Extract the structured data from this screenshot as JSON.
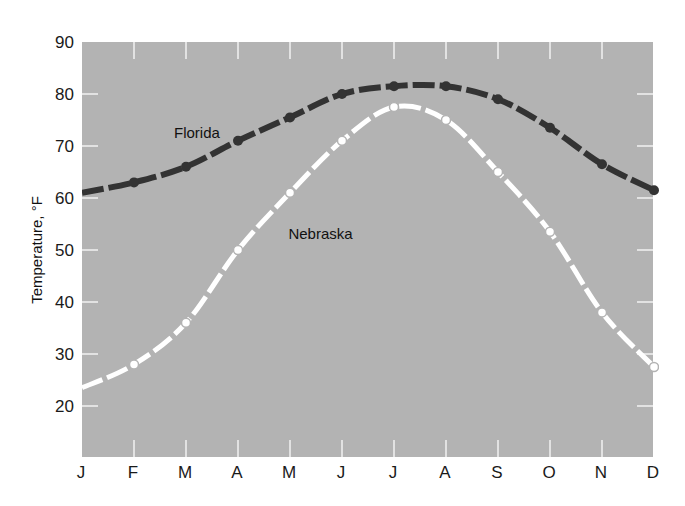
{
  "chart_data": {
    "type": "line",
    "title": "",
    "xlabel": "",
    "ylabel": "Temperature, °F",
    "categories": [
      "J",
      "F",
      "M",
      "A",
      "M",
      "J",
      "J",
      "A",
      "S",
      "O",
      "N",
      "D"
    ],
    "ylim": [
      10,
      90
    ],
    "yticks": [
      20,
      30,
      40,
      50,
      60,
      70,
      80,
      90
    ],
    "grid": false,
    "legend": "inline labels",
    "series": [
      {
        "name": "Florida",
        "color": "#333333",
        "marker": "filled-circle",
        "line_style": "dashed",
        "values": [
          61,
          63,
          66,
          71,
          75.5,
          80,
          81.5,
          81.5,
          79,
          73.5,
          66.5,
          61.5
        ]
      },
      {
        "name": "Nebraska",
        "color": "#ffffff",
        "marker": "open-circle",
        "line_style": "dashed",
        "values": [
          23.5,
          28,
          36,
          50,
          61,
          71,
          77.5,
          75,
          65,
          53.5,
          38,
          27.5
        ]
      }
    ],
    "annotations": [
      {
        "text": "Florida",
        "x_month_index": 2,
        "y": 72.5
      },
      {
        "text": "Nebraska",
        "x_month_index": 4.2,
        "y": 53
      }
    ]
  },
  "colors": {
    "plot_background": "#b3b3b3",
    "tick_marks": "#f2f2f2"
  }
}
